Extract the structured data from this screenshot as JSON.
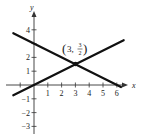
{
  "chart_data": {
    "type": "line",
    "title": "",
    "xlabel": "x",
    "ylabel": "y",
    "xlim": [
      -2,
      6.6
    ],
    "ylim": [
      -3.5,
      4.8
    ],
    "x_ticks": [
      1,
      2,
      3,
      4,
      5,
      6
    ],
    "y_ticks": [
      -3,
      -2,
      -1,
      1,
      2,
      4
    ],
    "x_tick_labels": [
      "1",
      "2",
      "3",
      "4",
      "5",
      "6"
    ],
    "y_tick_labels": [
      "−3",
      "−2",
      "−1",
      "1",
      "2",
      "4"
    ],
    "grid": false,
    "legend": null,
    "series": [
      {
        "name": "y = x/2",
        "x": [
          -1.5,
          6.5
        ],
        "y": [
          -0.75,
          3.25
        ]
      },
      {
        "name": "y = -x/2 + 3",
        "x": [
          -1.5,
          6.3
        ],
        "y": [
          3.75,
          -0.15
        ]
      }
    ],
    "annotations": [
      {
        "text": "(3, 3/2)",
        "x": 3,
        "y": 1.5,
        "type": "intersection-point"
      }
    ]
  },
  "labels": {
    "x_axis": "x",
    "y_axis": "y",
    "point_open": "(",
    "point_x": "3,",
    "point_num": "3",
    "point_den": "2",
    "point_close": ")"
  }
}
